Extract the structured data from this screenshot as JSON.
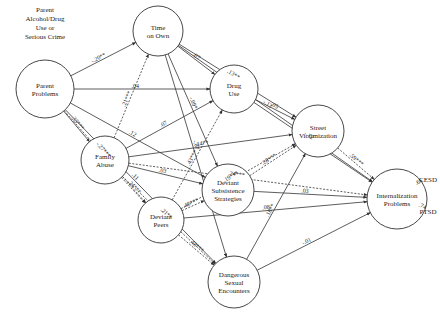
{
  "header": {
    "lines": [
      "Parent",
      "Alcohol/Drug",
      "Use or",
      "Serious Crime"
    ]
  },
  "nodes": [
    {
      "id": "parent",
      "lines": [
        "Parent",
        "Problems"
      ],
      "x": 45,
      "y": 89,
      "r": 29
    },
    {
      "id": "time",
      "lines": [
        "Time",
        "on Own"
      ],
      "x": 158,
      "y": 31,
      "r": 25
    },
    {
      "id": "drug",
      "lines": [
        "Drug",
        "Use"
      ],
      "x": 234,
      "y": 89,
      "r": 24
    },
    {
      "id": "street",
      "lines": [
        "Street",
        "Victimization"
      ],
      "x": 318,
      "y": 131,
      "r": 26
    },
    {
      "id": "family",
      "lines": [
        "Family",
        "Abuse"
      ],
      "x": 105,
      "y": 160,
      "r": 24
    },
    {
      "id": "subsist",
      "lines": [
        "Deviant",
        "Subsistence",
        "Strategies"
      ],
      "x": 228,
      "y": 190,
      "r": 26
    },
    {
      "id": "peers",
      "lines": [
        "Deviant",
        "Peers"
      ],
      "x": 161,
      "y": 220,
      "r": 23
    },
    {
      "id": "internal",
      "lines": [
        "Internalization",
        "Problems"
      ],
      "x": 397,
      "y": 199,
      "r": 30
    },
    {
      "id": "sexual",
      "lines": [
        "Dangerous",
        "Sexual",
        "Encounters"
      ],
      "x": 234,
      "y": 282,
      "r": 26
    }
  ],
  "indicators": [
    {
      "id": "cesd",
      "label": "CESD",
      "x": 428,
      "y": 180
    },
    {
      "id": "ptsd",
      "label": "PTSD",
      "x": 428,
      "y": 212
    }
  ],
  "edges": [
    {
      "from": "parent",
      "to": "time",
      "label": "-.20**",
      "style": "solid"
    },
    {
      "from": "parent",
      "to": "drug",
      "label": ".04",
      "style": "solid"
    },
    {
      "from": "parent",
      "to": "subsist",
      "label": ".12",
      "style": "solid"
    },
    {
      "from": "parent",
      "to": "family",
      "label": ".33***",
      "style": "solid"
    },
    {
      "from": "parent",
      "to": "peers",
      "label": "-.27***",
      "style": "dashed"
    },
    {
      "from": "parent",
      "to": "sexual",
      "label": ".11",
      "style": "solid"
    },
    {
      "from": "time",
      "to": "internal",
      "label": "-.13",
      "style": "solid"
    },
    {
      "from": "time",
      "to": "street",
      "label": ".13**",
      "style": "solid"
    },
    {
      "from": "time",
      "to": "drug",
      "label": ".07",
      "style": "solid"
    },
    {
      "from": "time",
      "to": "subsist",
      "label": "-.09*",
      "style": "solid"
    },
    {
      "from": "time",
      "to": "sexual",
      "label": "-.07",
      "style": "solid"
    },
    {
      "from": "drug",
      "to": "internal",
      "label": "-.12",
      "style": "solid"
    },
    {
      "from": "drug",
      "to": "street",
      "label": ".05",
      "style": "solid"
    },
    {
      "from": "street",
      "to": "internal",
      "label": ".59***",
      "style": "dashed"
    },
    {
      "from": "family",
      "to": "time",
      "label": ".21***",
      "style": "dashed"
    },
    {
      "from": "family",
      "to": "drug",
      "label": ".07",
      "style": "solid"
    },
    {
      "from": "family",
      "to": "street",
      "label": ".14**",
      "style": "solid"
    },
    {
      "from": "family",
      "to": "internal",
      "label": ".24***",
      "style": "dashed"
    },
    {
      "from": "family",
      "to": "subsist",
      "label": ".03",
      "style": "solid"
    },
    {
      "from": "family",
      "to": "peers",
      "label": ".24***",
      "style": "dashed"
    },
    {
      "from": "family",
      "to": "sexual",
      "label": ".21**",
      "style": "dashed"
    },
    {
      "from": "subsist",
      "to": "street",
      "label": ".28***",
      "style": "dashed"
    },
    {
      "from": "subsist",
      "to": "internal",
      "label": ".03",
      "style": "solid"
    },
    {
      "from": "peers",
      "to": "drug",
      "label": ".43***",
      "style": "dashed"
    },
    {
      "from": "peers",
      "to": "subsist",
      "label": ".48***",
      "style": "dashed"
    },
    {
      "from": "peers",
      "to": "street",
      "label": ".19***",
      "style": "dashed"
    },
    {
      "from": "peers",
      "to": "internal",
      "label": ".08",
      "style": "solid"
    },
    {
      "from": "peers",
      "to": "sexual",
      "label": ".48***",
      "style": "dashed"
    },
    {
      "from": "sexual",
      "to": "street",
      "label": ".18**",
      "style": "solid"
    },
    {
      "from": "sexual",
      "to": "internal",
      "label": "-.01",
      "style": "solid"
    },
    {
      "from": "internal",
      "to": "cesd",
      "label": ".65",
      "style": "solid"
    },
    {
      "from": "internal",
      "to": "ptsd",
      "label": ".74",
      "style": "solid"
    }
  ],
  "label_positions": {
    "-.20**": [
      112,
      48,
      -37
    ],
    ".04": [
      92,
      84,
      0
    ],
    ".12": [
      107,
      107,
      20
    ],
    ".33***": [
      74,
      110,
      55
    ],
    "-.27***": [
      63,
      120,
      70
    ],
    ".11": [
      50,
      155,
      88
    ],
    "-.13": [
      266,
      31,
      0
    ],
    ".13**": [
      268,
      43,
      5
    ],
    ".07a": [
      205,
      54,
      30
    ],
    "-.09*": [
      200,
      72,
      80
    ],
    "-.07": [
      199,
      127,
      80
    ],
    "-.12": [
      292,
      83,
      0
    ],
    ".05": [
      283,
      103,
      35
    ],
    ".59***": [
      340,
      145,
      45
    ],
    ".21***": [
      128,
      92,
      -75
    ],
    ".07b": [
      157,
      128,
      -35
    ],
    ".14**": [
      200,
      147,
      -8
    ],
    ".24***": [
      237,
      164,
      -2
    ],
    ".03a": [
      178,
      170,
      15
    ],
    ".24***b": [
      122,
      184,
      55
    ],
    ".21**": [
      106,
      205,
      90
    ],
    ".28***": [
      262,
      163,
      -45
    ],
    ".03b": [
      318,
      192,
      0
    ],
    ".43***": [
      181,
      193,
      -75
    ],
    ".48***a": [
      188,
      210,
      -30
    ],
    ".19***": [
      292,
      208,
      -12
    ],
    ".08": [
      325,
      207,
      0
    ],
    ".48***b": [
      193,
      245,
      55
    ],
    ".18**": [
      259,
      260,
      -70
    ],
    "-.01": [
      268,
      263,
      -30
    ],
    ".65": [
      400,
      185,
      -55
    ],
    ".74": [
      402,
      210,
      60
    ]
  }
}
